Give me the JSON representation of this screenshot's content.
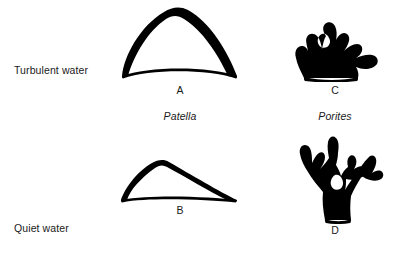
{
  "figure": {
    "background_color": "#ffffff",
    "ink_color": "#000000",
    "text_color": "#1a1a1a"
  },
  "row_labels": [
    {
      "id": "turbulent",
      "label": "Turbulent water"
    },
    {
      "id": "quiet",
      "label": "Quiet water"
    }
  ],
  "species": [
    {
      "id": "patella",
      "name": "Patella"
    },
    {
      "id": "porites",
      "name": "Porites"
    }
  ],
  "panels": [
    {
      "letter": "A",
      "species": "Patella",
      "condition": "Turbulent water",
      "shape": "tall-peaked-limpet-shell"
    },
    {
      "letter": "B",
      "species": "Patella",
      "condition": "Quiet water",
      "shape": "low-flat-limpet-shell"
    },
    {
      "letter": "C",
      "species": "Porites",
      "condition": "Turbulent water",
      "shape": "squat-stubby-branching-coral"
    },
    {
      "letter": "D",
      "species": "Porites",
      "condition": "Quiet water",
      "shape": "tall-open-branching-coral"
    }
  ]
}
